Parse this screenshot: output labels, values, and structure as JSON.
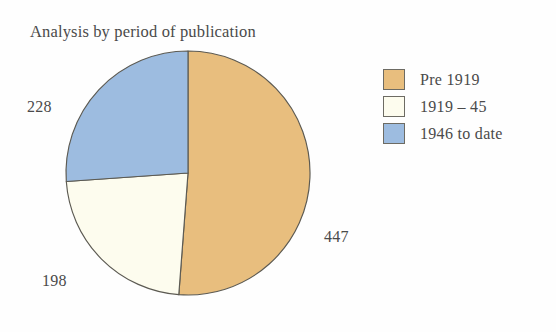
{
  "chart_data": {
    "type": "pie",
    "title": "Analysis by period of publication",
    "categories": [
      "Pre 1919",
      "1919 – 45",
      "1946 to date"
    ],
    "values": [
      447,
      198,
      228
    ],
    "total": 873,
    "labels": [
      "447",
      "198",
      "228"
    ],
    "colors": [
      "#e8be7e",
      "#fdfcee",
      "#9dbce0"
    ],
    "slice_outline_color": "#5c5a52",
    "start_angle_deg": 0,
    "direction": "clockwise",
    "legend": {
      "position": "right",
      "entries": [
        {
          "label": "Pre 1919",
          "color": "#e8be7e"
        },
        {
          "label": "1919 – 45",
          "color": "#fdfcee"
        },
        {
          "label": "1946 to date",
          "color": "#9dbce0"
        }
      ]
    },
    "xlabel": "",
    "ylabel": "",
    "grid": false,
    "background": "#fefefe",
    "text_color": "#4a4a4a"
  }
}
